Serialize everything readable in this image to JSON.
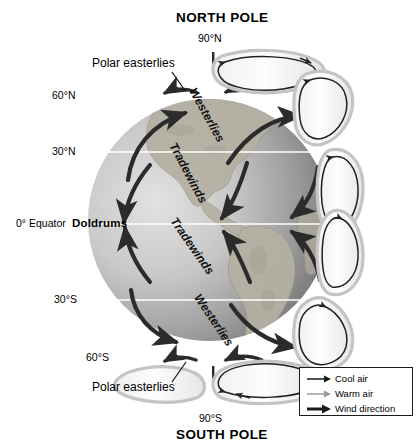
{
  "diagram": {
    "type": "earth-wind-circulation"
  },
  "poles": {
    "north": {
      "name": "NORTH POLE",
      "latitude": "90°N"
    },
    "south": {
      "name": "SOUTH POLE",
      "latitude": "90°S"
    }
  },
  "latitudes": [
    {
      "id": "lat-60n",
      "label": "60°N"
    },
    {
      "id": "lat-30n",
      "label": "30°N"
    },
    {
      "id": "lat-eq",
      "label": "0° Equator"
    },
    {
      "id": "lat-30s",
      "label": "30°S"
    },
    {
      "id": "lat-60s",
      "label": "60°S"
    }
  ],
  "annotations": {
    "polar_easterlies_north": "Polar easterlies",
    "polar_easterlies_south": "Polar easterlies",
    "doldrums": "Doldrums"
  },
  "wind_bands": [
    {
      "id": "band-westerlies-n",
      "label": "Westerlies",
      "hemisphere": "north"
    },
    {
      "id": "band-tradewinds-n",
      "label": "Tradewinds",
      "hemisphere": "north"
    },
    {
      "id": "band-tradewinds-s",
      "label": "Tradewinds",
      "hemisphere": "south"
    },
    {
      "id": "band-westerlies-s",
      "label": "Westerlies",
      "hemisphere": "south"
    }
  ],
  "legend": {
    "items": [
      {
        "id": "legend-cool-air",
        "label": "Cool air",
        "symbol": "thin-dark-arrow",
        "color": "#1a1a1a"
      },
      {
        "id": "legend-warm-air",
        "label": "Warm air",
        "symbol": "thin-gray-arrow",
        "color": "#9a9a9a"
      },
      {
        "id": "legend-wind-direction",
        "label": "Wind direction",
        "symbol": "thick-dark-arrow",
        "color": "#1a1a1a"
      }
    ]
  },
  "colors": {
    "background": "#ffffff",
    "globe_light": "#d8d8d8",
    "globe_dark": "#6f6f6f",
    "land": "#b9b4a8",
    "arrow_dark": "#2b2b2b",
    "cell_fill": "#fbfbfb",
    "cell_stroke": "#c9c9c9",
    "latitude_line": "#ffffff",
    "text": "#000000"
  }
}
